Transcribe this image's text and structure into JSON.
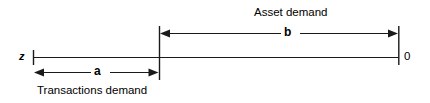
{
  "figure": {
    "type": "number-line-diagram",
    "background_color": "#ffffff",
    "stroke_color": "#1a1a1a",
    "axis": {
      "left_endpoint_label": "z",
      "right_endpoint_label": "0",
      "left_x": 33,
      "divider_x": 159,
      "right_x": 399,
      "y": 57
    },
    "segments": [
      {
        "name": "transactions-demand",
        "measure_label": "a",
        "caption": "Transactions demand",
        "from_x": 33,
        "to_x": 159,
        "arrow_y": 72,
        "arrows": "both",
        "caption_position": "below"
      },
      {
        "name": "asset-demand",
        "measure_label": "b",
        "caption": "Asset demand",
        "from_x": 159,
        "to_x": 399,
        "arrow_y": 33,
        "arrows": "both",
        "caption_position": "above"
      }
    ]
  }
}
